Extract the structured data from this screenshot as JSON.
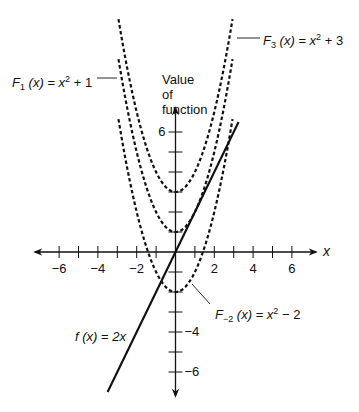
{
  "chart_data": {
    "type": "line",
    "title": "",
    "xlabel": "x",
    "ylabel": "Value of function",
    "ylabel_lines": [
      "Value",
      "of",
      "function"
    ],
    "xlim": [
      -7,
      7
    ],
    "ylim": [
      -7,
      11.5
    ],
    "grid": false,
    "x_ticks": [
      -6,
      -5,
      -4,
      -3,
      -2,
      -1,
      1,
      2,
      3,
      4,
      5,
      6
    ],
    "x_tick_labels": [
      {
        "value": -6,
        "label": "−6"
      },
      {
        "value": -4,
        "label": "−4"
      },
      {
        "value": -2,
        "label": "−2"
      },
      {
        "value": 2,
        "label": "2"
      },
      {
        "value": 4,
        "label": "4"
      },
      {
        "value": 6,
        "label": "6"
      }
    ],
    "y_ticks": [
      -6,
      -5,
      -4,
      -3,
      -2,
      -1,
      1,
      2,
      3,
      4,
      5,
      6
    ],
    "y_tick_labels": [
      {
        "value": 6,
        "label": "6"
      },
      {
        "value": -4,
        "label": "−4"
      },
      {
        "value": -6,
        "label": "−6"
      }
    ],
    "series": [
      {
        "name": "F3(x) = x^2 + 3",
        "style": "dashed",
        "formula": "x^2+3",
        "x_range": [
          -2.94,
          2.94
        ],
        "vertex": [
          0,
          3
        ],
        "label": {
          "fn": "F",
          "sub": "3",
          "arg": "(x)",
          "rhs_base": "x",
          "rhs_exp": "2",
          "rhs_tail": "+ 3"
        }
      },
      {
        "name": "F1(x) = x^2 + 1",
        "style": "dashed",
        "formula": "x^2+1",
        "x_range": [
          -2.94,
          2.94
        ],
        "vertex": [
          0,
          1
        ],
        "label": {
          "fn": "F",
          "sub": "1",
          "arg": "(x)",
          "rhs_base": "x",
          "rhs_exp": "2",
          "rhs_tail": "+ 1"
        }
      },
      {
        "name": "F-2(x) = x^2 - 2",
        "style": "dashed",
        "formula": "x^2-2",
        "x_range": [
          -2.94,
          2.94
        ],
        "vertex": [
          0,
          -2
        ],
        "label": {
          "fn": "F",
          "sub": "−2",
          "arg": "(x)",
          "rhs_base": "x",
          "rhs_exp": "2",
          "rhs_tail": "− 2"
        }
      },
      {
        "name": "f(x) = 2x",
        "style": "solid",
        "formula": "2x",
        "x_range": [
          -3.5,
          3.25
        ],
        "label": {
          "fn": "f",
          "sub": "",
          "arg": "(x)",
          "rhs_base": "2x",
          "rhs_exp": "",
          "rhs_tail": ""
        }
      }
    ]
  },
  "geometry": {
    "origin_x": 175.5,
    "origin_y": 252,
    "unit_x": 19.4,
    "unit_y": 20,
    "xaxis_left": 35,
    "xaxis_right": 316,
    "yaxis_top": 108,
    "yaxis_bottom": 396
  },
  "text": {
    "x_axis_label": "x",
    "y_label_1": "Value",
    "y_label_2": "of",
    "y_label_3": "function",
    "eq": "="
  }
}
